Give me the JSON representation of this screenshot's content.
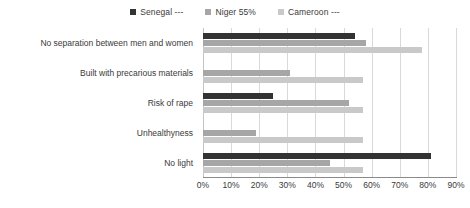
{
  "chart_data": {
    "type": "bar",
    "orientation": "horizontal",
    "title": "",
    "xlabel": "",
    "ylabel": "",
    "xlim": [
      0,
      90
    ],
    "grid": true,
    "legend_position": "top-center",
    "categories": [
      "No separation between men and women",
      "Built with precarious materials",
      "Risk of rape",
      "Unhealthyness",
      "No light"
    ],
    "tick_labels": [
      "0%",
      "10%",
      "20%",
      "30%",
      "40%",
      "50%",
      "60%",
      "70%",
      "80%",
      "90%"
    ],
    "tick_values": [
      0,
      10,
      20,
      30,
      40,
      50,
      60,
      70,
      80,
      90
    ],
    "series": [
      {
        "name": "Senegal ---",
        "color": "#333333",
        "values": [
          54,
          null,
          25,
          null,
          81
        ]
      },
      {
        "name": "Niger 55%",
        "color": "#a6a6a6",
        "values": [
          58,
          31,
          52,
          19,
          45
        ]
      },
      {
        "name": "Cameroon ---",
        "color": "#c9c9c9",
        "values": [
          78,
          57,
          57,
          57,
          57
        ]
      }
    ]
  },
  "legend": {
    "items": [
      {
        "label": "Senegal ---",
        "color": "#333333"
      },
      {
        "label": "Niger 55%",
        "color": "#a6a6a6"
      },
      {
        "label": "Cameroon ---",
        "color": "#c9c9c9"
      }
    ]
  }
}
